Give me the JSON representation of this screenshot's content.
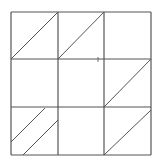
{
  "diagram": {
    "type": "3x3 grid with diagonal lines",
    "stroke_color": "#555555",
    "background": "#ffffff",
    "grid": {
      "rows": 3,
      "cols": 3,
      "x_lines": [
        11,
        58,
        104,
        151
      ],
      "y_lines": [
        12,
        59,
        107,
        155
      ]
    },
    "diagonals": [
      {
        "cell": "r1c1",
        "x1": 11,
        "y1": 59,
        "x2": 58,
        "y2": 12
      },
      {
        "cell": "r1c2",
        "x1": 58,
        "y1": 59,
        "x2": 104,
        "y2": 12
      },
      {
        "cell": "r2c3",
        "x1": 104,
        "y1": 107,
        "x2": 151,
        "y2": 59
      },
      {
        "cell": "r3c1-a",
        "x1": 11,
        "y1": 142,
        "x2": 45,
        "y2": 108
      },
      {
        "cell": "r3c1-b",
        "x1": 23,
        "y1": 155,
        "x2": 58,
        "y2": 120
      },
      {
        "cell": "r3c3",
        "x1": 104,
        "y1": 155,
        "x2": 151,
        "y2": 110
      }
    ],
    "marks": [
      {
        "name": "small-tick",
        "x1": 98,
        "y1": 57,
        "x2": 98,
        "y2": 62
      }
    ]
  }
}
